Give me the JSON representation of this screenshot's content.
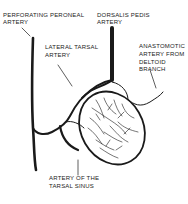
{
  "diagram": {
    "labels": {
      "perforating_peroneal_line1": "PERFORATING PERONEAL",
      "perforating_peroneal_line2": "ARTERY",
      "dorsalis_pedis_line1": "DORSALIS PEDIS",
      "dorsalis_pedis_line2": "ARTERY",
      "lateral_tarsal_line1": "LATERAL TARSAL",
      "lateral_tarsal_line2": "ARTERY",
      "anastomotic_line1": "ANASTOMOTIC",
      "anastomotic_line2": "ARTERY FROM",
      "anastomotic_line3": "DELTOID",
      "anastomotic_line4": "BRANCH",
      "tarsal_sinus_line1": "ARTERY OF THE",
      "tarsal_sinus_line2": "TARSAL SINUS"
    },
    "colors": {
      "ink": "#1a1a1a",
      "background": "#ffffff"
    }
  }
}
